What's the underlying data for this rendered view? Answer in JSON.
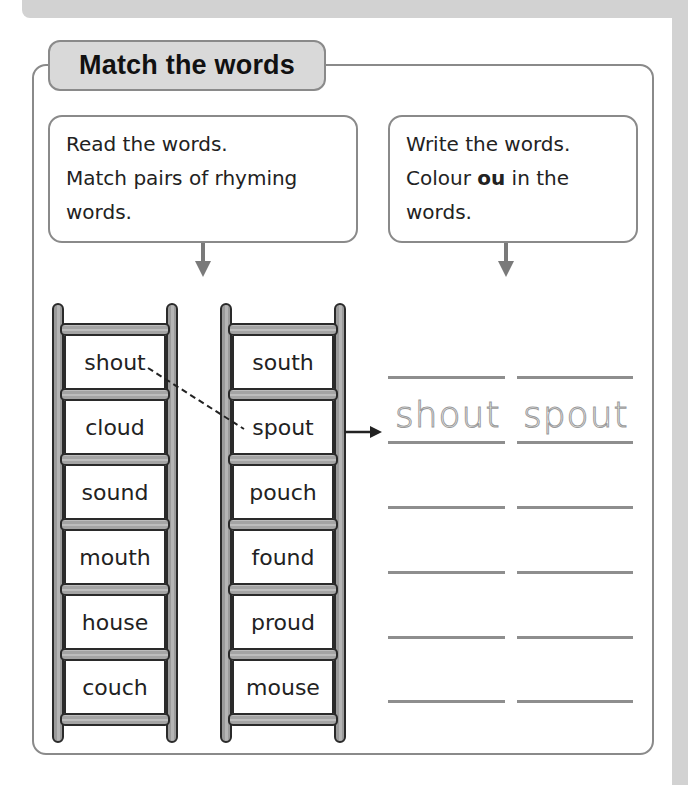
{
  "activity": {
    "title": "Match the words",
    "instructions_left": {
      "lines": [
        "Read the words.",
        "Match pairs of rhyming",
        "words."
      ]
    },
    "instructions_right": {
      "line1": "Write the words.",
      "line2_pre": "Colour ",
      "line2_bold": "ou",
      "line2_post": " in the",
      "line3": "words."
    }
  },
  "ladders": {
    "left": [
      "shout",
      "cloud",
      "sound",
      "mouth",
      "house",
      "couch"
    ],
    "right": [
      "south",
      "spout",
      "pouch",
      "found",
      "proud",
      "mouse"
    ]
  },
  "example_match": {
    "from": "shout",
    "to": "spout"
  },
  "writing_lines": {
    "rows": 6,
    "example_row": 1,
    "example_words": [
      "shout",
      "spout"
    ]
  },
  "colors": {
    "border": "#8a8a8a",
    "badge_fill": "#d9d9d9",
    "page_margin": "#d2d2d2",
    "text": "#222222"
  }
}
